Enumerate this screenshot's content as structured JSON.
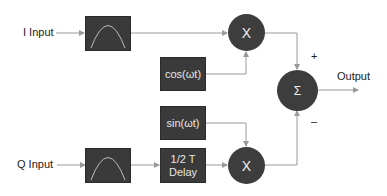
{
  "diagram": {
    "type": "IQ modulator block diagram",
    "inputs": {
      "i_input": "I Input",
      "q_input": "Q Input"
    },
    "filters": {
      "i_filter": "filter-icon",
      "q_filter": "filter-icon"
    },
    "oscillators": {
      "cos": "cos(ωt)",
      "sin": "sin(ωt)"
    },
    "delay": {
      "line1": "1/2 T",
      "line2": "Delay"
    },
    "multipliers": {
      "top": "X",
      "bottom": "X"
    },
    "summer": {
      "symbol": "Σ",
      "plus": "+",
      "minus": "–"
    },
    "output": "Output",
    "colors": {
      "block_fill": "#3a3a3a",
      "block_text": "#e6e6e6",
      "line": "#9a9a9a",
      "label": "#222222"
    }
  }
}
